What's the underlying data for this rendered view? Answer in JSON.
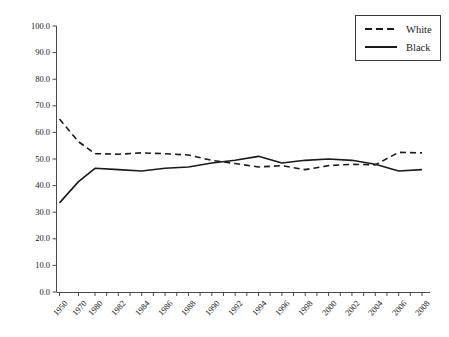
{
  "chart_data": {
    "type": "line",
    "title": "",
    "xlabel": "",
    "ylabel": "",
    "ylim": [
      0.0,
      100.0
    ],
    "ytick_labels": [
      "0.0",
      "10.0",
      "20.0",
      "30.0",
      "40.0",
      "50.0",
      "60.0",
      "70.0",
      "80.0",
      "90.0",
      "100.0"
    ],
    "ytick_values": [
      0,
      10,
      20,
      30,
      40,
      50,
      60,
      70,
      80,
      90,
      100
    ],
    "grid": false,
    "legend_position": "top-right",
    "categories": [
      "1950",
      "1970",
      "1980",
      "1982",
      "1984",
      "1986",
      "1988",
      "1990",
      "1992",
      "1994",
      "1996",
      "1998",
      "2000",
      "2002",
      "2004",
      "2006",
      "2008"
    ],
    "series": [
      {
        "name": "White",
        "style": "dashed",
        "color": "#1a1a1a",
        "values": [
          65.0,
          56.5,
          52.0,
          51.8,
          52.3,
          52.0,
          51.5,
          49.5,
          48.3,
          47.0,
          47.5,
          46.0,
          47.5,
          48.0,
          47.8,
          52.5,
          52.3
        ]
      },
      {
        "name": "Black",
        "style": "solid",
        "color": "#1a1a1a",
        "values": [
          33.5,
          41.5,
          46.5,
          46.0,
          45.5,
          46.5,
          47.0,
          48.5,
          49.5,
          51.0,
          48.5,
          49.5,
          50.0,
          49.5,
          48.0,
          45.5,
          46.0
        ]
      }
    ]
  },
  "legend": {
    "entries": [
      {
        "label": "White",
        "style": "dashed"
      },
      {
        "label": "Black",
        "style": "solid"
      }
    ]
  }
}
